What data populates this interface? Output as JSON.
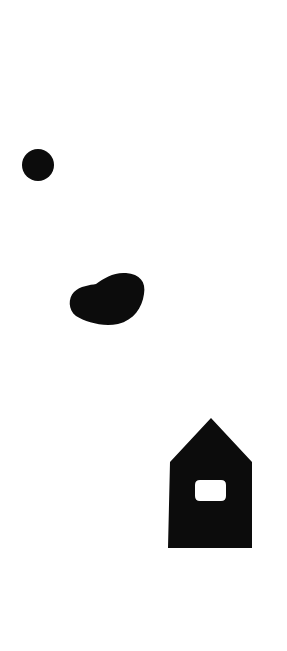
{
  "canvas": {
    "width": 287,
    "height": 651,
    "background": "#ffffff"
  },
  "shapes": [
    {
      "name": "circle",
      "kind": "circle",
      "fill": "#0c0c0c",
      "cx": 38,
      "cy": 165,
      "r": 16
    },
    {
      "name": "blob",
      "kind": "irregular-blob",
      "fill": "#0c0c0c",
      "bbox": [
        70,
        272,
        145,
        325
      ]
    },
    {
      "name": "house",
      "kind": "house-pentagon",
      "fill": "#0c0c0c",
      "apex": [
        211,
        418
      ],
      "shoulders": [
        [
          170,
          462
        ],
        [
          252,
          462
        ]
      ],
      "base_y": 548,
      "window": {
        "fill": "#ffffff",
        "x": 195,
        "y": 480,
        "width": 31,
        "height": 21,
        "radius": 5
      }
    }
  ]
}
